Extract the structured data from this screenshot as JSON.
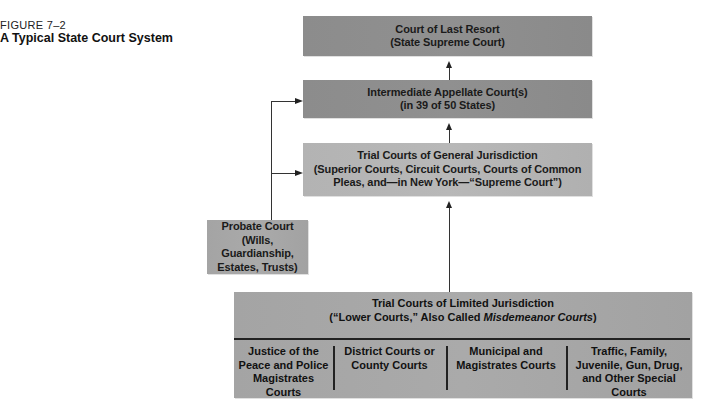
{
  "figure": {
    "label": "FIGURE 7–2",
    "title": "A Typical State Court System"
  },
  "boxes": {
    "last_resort": {
      "line1": "Court of Last Resort",
      "line2": "(State Supreme Court)"
    },
    "appellate": {
      "line1": "Intermediate Appellate Court(s)",
      "line2": "(in 39 of 50 States)"
    },
    "general": {
      "line1": "Trial Courts of General Jurisdiction",
      "line2": "(Superior Courts, Circuit Courts, Courts of Common",
      "line3": "Pleas, and—in New York—“Supreme Court”)"
    },
    "probate": {
      "line1": "Probate Court",
      "line2": "(Wills, Guardianship,",
      "line3": "Estates, Trusts)"
    },
    "limited": {
      "line1": "Trial Courts of Limited Jurisdiction",
      "line2_prefix": "(“Lower Courts,” Also Called ",
      "line2_italic": "Misdemeanor Courts",
      "line2_suffix": ")",
      "columns": [
        {
          "lines": [
            "Justice of the",
            "Peace and Police",
            "Magistrates Courts"
          ]
        },
        {
          "lines": [
            "District Courts or",
            "County Courts"
          ]
        },
        {
          "lines": [
            "Municipal and",
            "Magistrates Courts"
          ]
        },
        {
          "lines": [
            "Traffic, Family,",
            "Juvenile, Gun, Drug,",
            "and Other Special",
            "Courts"
          ]
        }
      ]
    }
  },
  "colors": {
    "dark_box": "#8c8c8c",
    "light_box": "#b5b5b5",
    "line": "#333333"
  }
}
